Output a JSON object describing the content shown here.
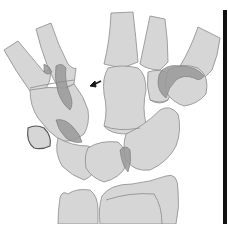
{
  "figure": {
    "type": "anatomical-diagram",
    "annotation": {
      "kind": "arrow",
      "direction": "left",
      "position": [
        95,
        83
      ]
    }
  },
  "colors": {
    "bone_fill": "#d6d6d6",
    "bone_outline": "#8c8c8c",
    "overlap_fill": "#9a9a9a",
    "arrow": "#1a1a1a",
    "frame_bar": "#111111",
    "background": "#ffffff"
  }
}
